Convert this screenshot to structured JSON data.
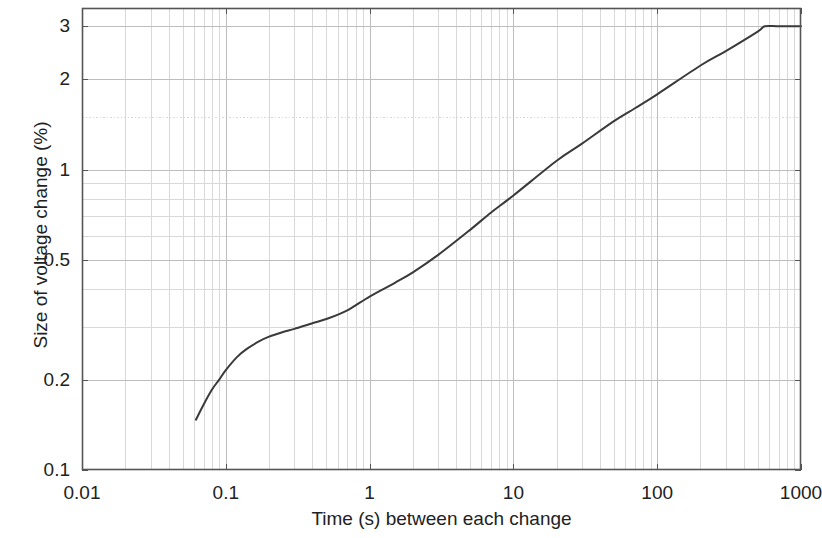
{
  "chart_data": {
    "type": "line",
    "title": "",
    "xlabel": "Time (s) between each change",
    "ylabel": "Size of voltage change (%)",
    "xscale": "log",
    "yscale": "log",
    "xlim": [
      0.01,
      1000
    ],
    "ylim": [
      0.1,
      3.45
    ],
    "grid": true,
    "grid_minor": true,
    "legend": "none",
    "xticks": [
      {
        "value": 0.01,
        "label": "0.01"
      },
      {
        "value": 0.1,
        "label": "0.1"
      },
      {
        "value": 1,
        "label": "1"
      },
      {
        "value": 10,
        "label": "10"
      },
      {
        "value": 100,
        "label": "100"
      },
      {
        "value": 1000,
        "label": "1000"
      }
    ],
    "yticks": [
      {
        "value": 0.1,
        "label": "0.1"
      },
      {
        "value": 0.2,
        "label": "0.2"
      },
      {
        "value": 0.5,
        "label": "0.5"
      },
      {
        "value": 1,
        "label": "1"
      },
      {
        "value": 2,
        "label": "2"
      },
      {
        "value": 3,
        "label": "3"
      }
    ],
    "series": [
      {
        "name": "Flicker perception threshold",
        "color": "#3a3a3a",
        "line_width": 2,
        "x": [
          0.062,
          0.07,
          0.08,
          0.09,
          0.1,
          0.12,
          0.14,
          0.17,
          0.2,
          0.25,
          0.3,
          0.4,
          0.5,
          0.7,
          1.0,
          1.5,
          2.0,
          3.0,
          5.0,
          7.0,
          10.0,
          20.0,
          30.0,
          50.0,
          70.0,
          100.0,
          200.0,
          300.0,
          500.0,
          560.0,
          700.0,
          1000.0
        ],
        "y": [
          0.147,
          0.165,
          0.185,
          0.2,
          0.215,
          0.238,
          0.253,
          0.268,
          0.278,
          0.288,
          0.295,
          0.308,
          0.318,
          0.34,
          0.378,
          0.42,
          0.455,
          0.52,
          0.63,
          0.72,
          0.82,
          1.07,
          1.22,
          1.45,
          1.6,
          1.78,
          2.22,
          2.48,
          2.88,
          3.0,
          3.0,
          3.0
        ]
      }
    ],
    "annotations": [
      {
        "text": "plateau at 3% beyond approximately 560 s",
        "x": 560,
        "y": 3.0
      }
    ],
    "colors": {
      "axis": "#555555",
      "grid_major": "#bdbdbd",
      "grid_minor": "#d9d9d9",
      "curve": "#3a3a3a",
      "background": "#ffffff",
      "text": "#222222"
    }
  }
}
